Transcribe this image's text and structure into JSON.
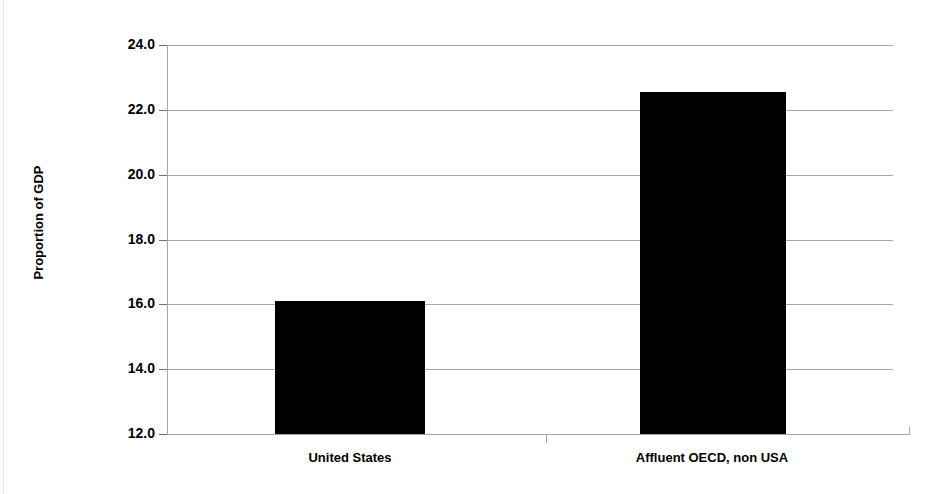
{
  "chart_data": {
    "type": "bar",
    "title": "",
    "subtitle": "",
    "xlabel": "",
    "ylabel": "Proportion of GDP",
    "categories": [
      "United States",
      "Affluent OECD, non USA"
    ],
    "values": [
      16.1,
      22.55
    ],
    "series": [
      {
        "name": "Proportion of GDP",
        "values": [
          16.1,
          22.55
        ]
      }
    ],
    "ylim": [
      12.0,
      24.0
    ],
    "ytick_labels": [
      "24.0",
      "22.0",
      "20.0",
      "18.0",
      "16.0",
      "14.0",
      "12.0"
    ],
    "ytick_values": [
      24.0,
      22.0,
      20.0,
      18.0,
      16.0,
      14.0,
      12.0
    ],
    "grid": true,
    "legend": null,
    "legend_position": "none",
    "bar_color": "#000000",
    "gridline_color": "#a6a6a6",
    "annotations": []
  },
  "axis": {
    "y_title": "Proportion of GDP"
  }
}
